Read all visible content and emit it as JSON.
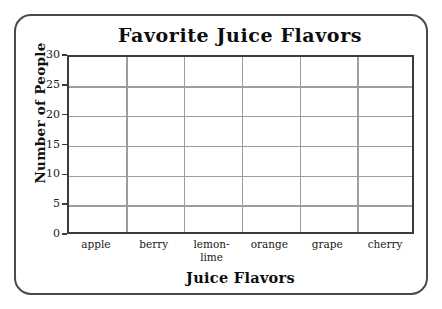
{
  "chart_data": {
    "type": "bar",
    "title": "Favorite Juice Flavors",
    "xlabel": "Juice Flavors",
    "ylabel": "Number of People",
    "categories": [
      "apple",
      "berry",
      "lemon-lime",
      "orange",
      "grape",
      "cherry"
    ],
    "values": [
      0,
      0,
      0,
      0,
      0,
      0
    ],
    "ylim": [
      0,
      30
    ],
    "ytick_labels": [
      "0",
      "5",
      "10",
      "15",
      "20",
      "25",
      "30"
    ],
    "ytick_values": [
      0,
      5,
      10,
      15,
      20,
      25,
      30
    ],
    "grid": "both",
    "legend": "none",
    "note": "Empty grid template; no bars are drawn for any category."
  },
  "style": {
    "plot_border_color": "#3b3b3b",
    "grid_color": "#9d9d9d",
    "card_border_color": "#4a4a4a",
    "background_color": "#ffffff",
    "text_color": "#1a1a1a"
  },
  "categories_display": [
    {
      "line1": "apple",
      "line2": ""
    },
    {
      "line1": "berry",
      "line2": ""
    },
    {
      "line1": "lemon-",
      "line2": "lime"
    },
    {
      "line1": "orange",
      "line2": ""
    },
    {
      "line1": "grape",
      "line2": ""
    },
    {
      "line1": "cherry",
      "line2": ""
    }
  ]
}
